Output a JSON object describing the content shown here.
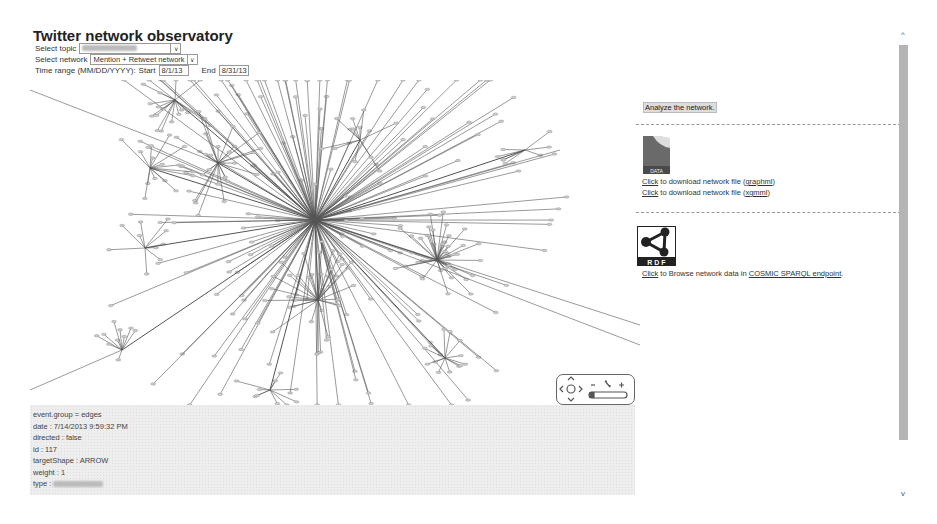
{
  "header": {
    "title": "Twitter network observatory"
  },
  "controls": {
    "topic_label": "Select topic",
    "topic_value": "",
    "network_label": "Select network",
    "network_value": "Mention + Retweet network",
    "time_label": "Time range (MM/DD/YYYY):",
    "start_label": "Start",
    "start_value": "8/1/13",
    "end_label": "End",
    "end_value": "8/31/13",
    "dropdown_icon": "chevron-down"
  },
  "graph": {
    "nav_widget": {
      "pan_up": "^",
      "pan_left": "<",
      "pan_right": ">",
      "pan_down": "v",
      "zoom_out": "-",
      "zoom_fit": "fit",
      "zoom_in": "+"
    }
  },
  "info_panel": {
    "lines": [
      "event.group = edges",
      "date : 7/14/2013 9:59:32 PM",
      "directed : false",
      "id : 117",
      "targetShape : ARROW",
      "weight : 1",
      "type :"
    ]
  },
  "sidebar": {
    "analyze_button": "Analyze the network.",
    "data_icon_label": "DATA",
    "download_items": [
      {
        "link": "Click",
        "text": " to download network file (",
        "format": "graphml",
        "close": ")"
      },
      {
        "link": "Click",
        "text": " to download network file (",
        "format": "xgmml",
        "close": ")"
      }
    ],
    "rdf_icon_label": "R D F",
    "browse": {
      "link": "Click",
      "text": " to Browse network data in ",
      "endpoint": "COSMIC SPARQL endpoint",
      "close": "."
    }
  },
  "scrollbar": {
    "up": "^",
    "down": "v"
  }
}
